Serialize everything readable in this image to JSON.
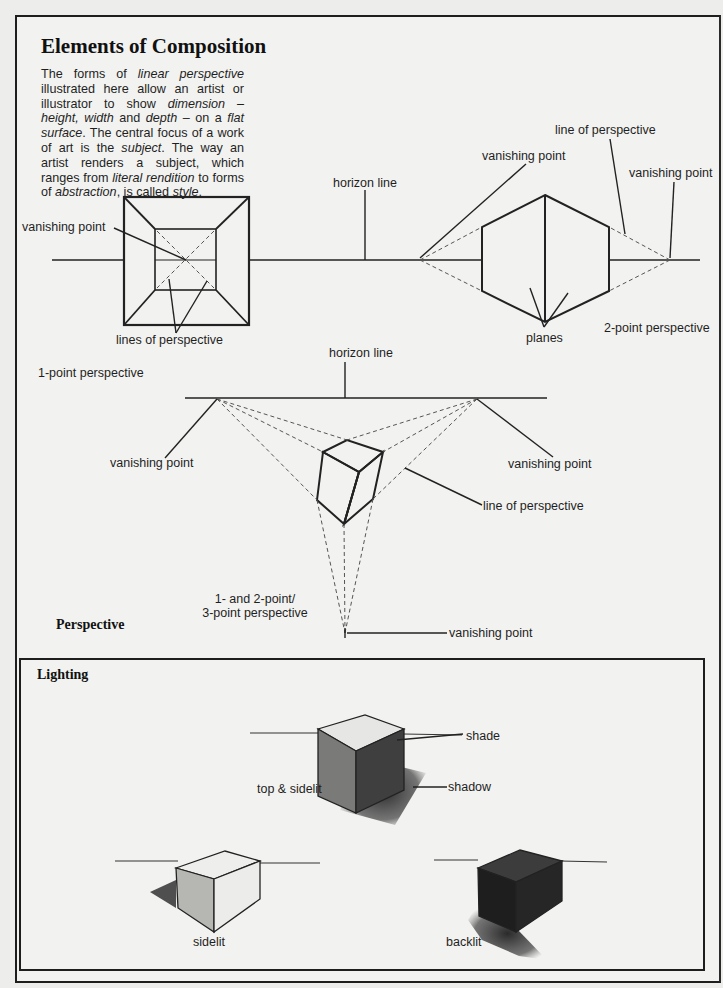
{
  "page": {
    "title": "Elements of Composition",
    "intro": {
      "segments": [
        {
          "text": "The forms of ",
          "italic": false
        },
        {
          "text": "linear perspective",
          "italic": true
        },
        {
          "text": " illustrated here allow an artist or illustrator to show ",
          "italic": false
        },
        {
          "text": "dimension – height, width",
          "italic": true
        },
        {
          "text": " and ",
          "italic": false
        },
        {
          "text": "depth",
          "italic": true
        },
        {
          "text": " – on a ",
          "italic": false
        },
        {
          "text": "flat surface",
          "italic": true
        },
        {
          "text": ". The central focus of a work of art is the ",
          "italic": false
        },
        {
          "text": "subject",
          "italic": true
        },
        {
          "text": ". The way an artist renders a subject, which ranges from ",
          "italic": false
        },
        {
          "text": "literal rendition",
          "italic": true
        },
        {
          "text": " to forms of ",
          "italic": false
        },
        {
          "text": "abstraction",
          "italic": true
        },
        {
          "text": ", is called ",
          "italic": false
        },
        {
          "text": "style",
          "italic": true
        },
        {
          "text": ".",
          "italic": false
        }
      ]
    }
  },
  "perspective": {
    "section_title": "Perspective",
    "one_point": {
      "caption": "1-point perspective",
      "vanishing_point": "vanishing point",
      "lines_of_perspective": "lines of perspective"
    },
    "two_point": {
      "caption": "2-point perspective",
      "horizon_line": "horizon line",
      "vanishing_point_left": "vanishing point",
      "vanishing_point_right": "vanishing point",
      "line_of_perspective": "line of perspective",
      "planes": "planes"
    },
    "three_point": {
      "caption_line1": "1- and 2-point/",
      "caption_line2": "3-point perspective",
      "horizon_line": "horizon line",
      "vanishing_point_left": "vanishing point",
      "vanishing_point_right": "vanishing point",
      "vanishing_point_bottom": "vanishing point",
      "line_of_perspective": "line of perspective"
    }
  },
  "lighting": {
    "section_title": "Lighting",
    "labels": {
      "shade": "shade",
      "shadow": "shadow",
      "top_sidelit": "top & sidelit",
      "sidelit": "sidelit",
      "backlit": "backlit"
    }
  }
}
